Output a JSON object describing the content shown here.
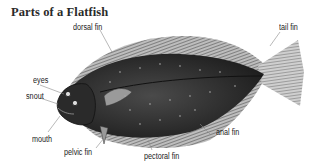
{
  "title": "Parts of a Flatfish",
  "labels": {
    "dorsal_fin": "dorsal fin",
    "tail_fin": "tail fin",
    "eyes": "eyes",
    "snout": "snout",
    "mouth": "mouth",
    "pelvic_fin": "pelvic fin",
    "pectoral_fin": "pectoral fin",
    "anal_fin": "anal fin"
  },
  "colors": {
    "body": "#3a3a3a",
    "fin": "#7a7a7a",
    "text": "#222222",
    "leader_line": "#8a8a8a"
  }
}
